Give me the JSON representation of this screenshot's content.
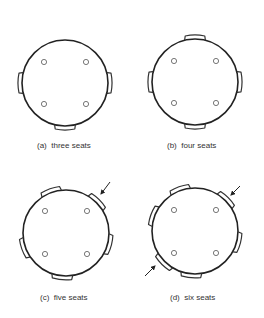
{
  "colors": {
    "background": "#ffffff",
    "stroke": "#222222",
    "seat_stroke": "#333333",
    "leg_stroke": "#555555",
    "label": "#333333"
  },
  "panels": [
    {
      "id": "a",
      "label": "(a)  three seats",
      "label_pos": [
        37,
        142
      ],
      "table": {
        "cx": 65,
        "cy": 83,
        "r": 43
      },
      "legs": [
        [
          44,
          62
        ],
        [
          86,
          62
        ],
        [
          44,
          104
        ],
        [
          86,
          104
        ]
      ],
      "seats_deg": [
        180,
        0,
        90
      ],
      "arrows": []
    },
    {
      "id": "b",
      "label": "(b)  four seats",
      "label_pos": [
        167,
        142
      ],
      "table": {
        "cx": 195,
        "cy": 82,
        "r": 43
      },
      "legs": [
        [
          174,
          61
        ],
        [
          216,
          61
        ],
        [
          174,
          103
        ],
        [
          216,
          103
        ]
      ],
      "seats_deg": [
        270,
        180,
        0,
        90
      ],
      "arrows": []
    },
    {
      "id": "c",
      "label": "(c)  five seats",
      "label_pos": [
        40,
        294
      ],
      "table": {
        "cx": 66,
        "cy": 233,
        "r": 43
      },
      "legs": [
        [
          45,
          211
        ],
        [
          87,
          211
        ],
        [
          45,
          254
        ],
        [
          87,
          254
        ]
      ],
      "seats_deg": [
        250,
        315,
        15,
        160,
        95
      ],
      "arrows": [
        {
          "from": [
            110,
            182
          ],
          "to": [
            101,
            194
          ]
        }
      ]
    },
    {
      "id": "d",
      "label": "(d)  six seats",
      "label_pos": [
        170,
        294
      ],
      "table": {
        "cx": 195,
        "cy": 231,
        "r": 43
      },
      "legs": [
        [
          174,
          210
        ],
        [
          216,
          210
        ],
        [
          174,
          253
        ],
        [
          216,
          253
        ]
      ],
      "seats_deg": [
        250,
        315,
        15,
        200,
        135,
        95
      ],
      "arrows": [
        {
          "from": [
            240,
            186
          ],
          "to": [
            231,
            195
          ]
        },
        {
          "from": [
            145,
            276
          ],
          "to": [
            155,
            266
          ]
        }
      ]
    }
  ]
}
